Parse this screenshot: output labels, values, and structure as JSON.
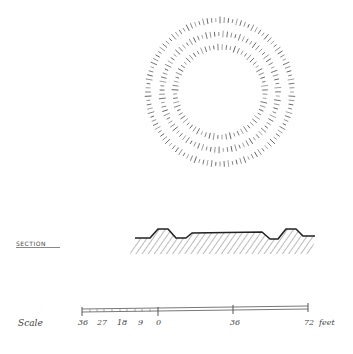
{
  "plan": {
    "description": "Plan view of a concentric ring earthwork (henge/ring ditch) drawn with radiating hachures",
    "rings": [
      {
        "name": "outer-bank",
        "radius": 72
      },
      {
        "name": "ditch",
        "radius": 58
      },
      {
        "name": "inner-bank",
        "radius": 45
      }
    ]
  },
  "section": {
    "label": "SECTION"
  },
  "scale": {
    "label": "Scale",
    "ticks": [
      "36",
      "27",
      "18",
      "9",
      "0",
      "36",
      "72"
    ],
    "unit": "feet"
  }
}
